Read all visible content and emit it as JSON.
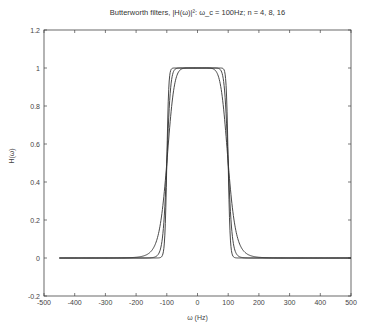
{
  "chart_data": {
    "type": "line",
    "title": "Butterworth filters, |H(ω)|²: ω_c = 100Hz; n = 4, 8, 16",
    "xlabel": "ω (Hz)",
    "ylabel": "H(ω)",
    "xlim": [
      -500,
      500
    ],
    "ylim": [
      -0.2,
      1.2
    ],
    "xticks": [
      -500,
      -400,
      -300,
      -200,
      -100,
      0,
      100,
      200,
      300,
      400,
      500
    ],
    "yticks": [
      -0.2,
      0,
      0.2,
      0.4,
      0.6,
      0.8,
      1,
      1.2
    ],
    "grid": false,
    "legend": null,
    "cutoff_hz": 100,
    "x_range_of_data": [
      -450,
      500
    ],
    "x": [
      -450,
      -400,
      -300,
      -200,
      -150,
      -125,
      -110,
      -100,
      -90,
      -80,
      -60,
      -40,
      0,
      40,
      60,
      80,
      90,
      100,
      110,
      125,
      150,
      200,
      300,
      400,
      500
    ],
    "series": [
      {
        "name": "n = 4",
        "order": 4,
        "values": [
          0.0,
          0.0,
          0.0002,
          0.0039,
          0.0374,
          0.143,
          0.3176,
          0.5,
          0.6939,
          0.8562,
          0.9835,
          0.9993,
          1.0,
          0.9993,
          0.9835,
          0.8562,
          0.6939,
          0.5,
          0.3176,
          0.143,
          0.0374,
          0.0039,
          0.0002,
          0.0,
          0.0
        ]
      },
      {
        "name": "n = 8",
        "order": 8,
        "values": [
          0.0,
          0.0,
          0.0,
          0.0,
          0.0015,
          0.0275,
          0.1775,
          0.5,
          0.8373,
          0.9728,
          0.9997,
          1.0,
          1.0,
          1.0,
          0.9997,
          0.9728,
          0.8373,
          0.5,
          0.1775,
          0.0275,
          0.0015,
          0.0,
          0.0,
          0.0,
          0.0
        ]
      },
      {
        "name": "n = 16",
        "order": 16,
        "values": [
          0.0,
          0.0,
          0.0,
          0.0,
          0.0,
          0.0008,
          0.0449,
          0.5,
          0.9641,
          0.9992,
          1.0,
          1.0,
          1.0,
          1.0,
          1.0,
          0.9992,
          0.9641,
          0.5,
          0.0449,
          0.0008,
          0.0,
          0.0,
          0.0,
          0.0,
          0.0
        ]
      }
    ],
    "line_color": "#333333"
  }
}
